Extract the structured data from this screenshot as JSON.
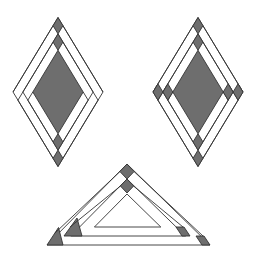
{
  "diagram": {
    "width": 253,
    "height": 256,
    "colors": {
      "background": "#ffffff",
      "stroke": "#333333",
      "fill_dark": "#6e6e6e",
      "fill_light": "#ffffff"
    },
    "figures": [
      {
        "name": "diamond-left",
        "type": "diamond",
        "cx": 58,
        "cy": 92,
        "hw": 45,
        "hh": 74.5,
        "rings": [
          1.0,
          0.78,
          0.56
        ],
        "center_scale": 0.56,
        "dark_squares": [
          "top-outer",
          "top-inner",
          "bottom-inner",
          "bottom-outer"
        ]
      },
      {
        "name": "diamond-right",
        "type": "diamond",
        "cx": 198,
        "cy": 92,
        "hw": 45,
        "hh": 74.5,
        "rings": [
          1.0,
          0.78,
          0.56
        ],
        "center_scale": 0.56,
        "dark_squares": [
          "top-outer",
          "top-inner",
          "bottom-inner",
          "bottom-outer",
          "left-outer",
          "left-inner",
          "right-inner",
          "right-outer"
        ]
      },
      {
        "name": "triangle-bottom",
        "type": "triangle",
        "apex": [
          127,
          164
        ],
        "base_y": 245,
        "base_left": 47,
        "base_right": 210
      }
    ]
  }
}
